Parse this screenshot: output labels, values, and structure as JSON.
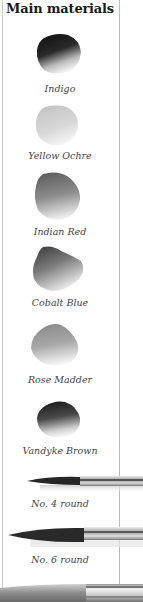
{
  "section": {
    "title": "Main materials"
  },
  "paints": [
    {
      "name": "Indigo",
      "icon": "paint-swatch-icon",
      "shade": "#1f1f24"
    },
    {
      "name": "Yellow Ochre",
      "icon": "paint-swatch-icon",
      "shade": "#b9b9b9"
    },
    {
      "name": "Indian Red",
      "icon": "paint-swatch-icon",
      "shade": "#6f6f6f"
    },
    {
      "name": "Cobalt Blue",
      "icon": "paint-swatch-icon",
      "shade": "#5a5a5a"
    },
    {
      "name": "Rose Madder",
      "icon": "paint-swatch-icon",
      "shade": "#8a8a8a"
    },
    {
      "name": "Vandyke Brown",
      "icon": "paint-swatch-icon",
      "shade": "#2a2a2a"
    }
  ],
  "brushes": [
    {
      "name": "No. 4 round",
      "icon": "round-brush-icon"
    },
    {
      "name": "No. 6 round",
      "icon": "round-brush-icon"
    },
    {
      "name": "",
      "icon": "flat-brush-icon"
    }
  ]
}
